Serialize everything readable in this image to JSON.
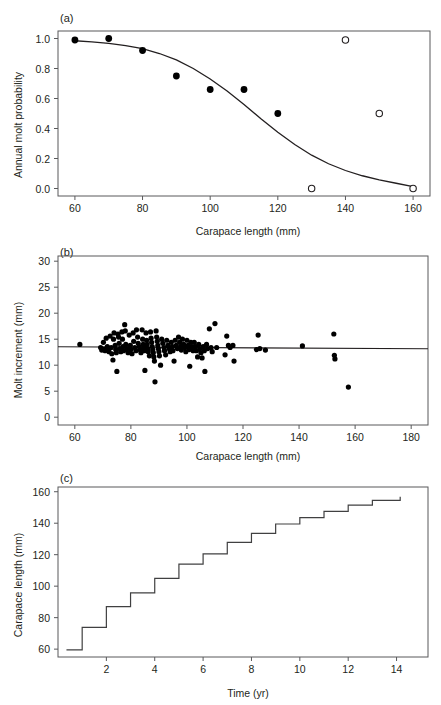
{
  "figure": {
    "width": 441,
    "height": 705,
    "background": "#ffffff",
    "ink_color": "#231f20",
    "frame_color": "#58595b"
  },
  "chart_data": [
    {
      "id": "panel-a",
      "type": "scatter",
      "panel_label": "(a)",
      "title": "",
      "xlabel": "Carapace length (mm)",
      "ylabel": "Annual molt probability",
      "xlim": [
        55,
        165
      ],
      "ylim": [
        -0.05,
        1.05
      ],
      "xticks": [
        60,
        80,
        100,
        120,
        140,
        160
      ],
      "xticklabels": [
        "60",
        "80",
        "100",
        "120",
        "140",
        "160"
      ],
      "yticks": [
        0.0,
        0.2,
        0.4,
        0.6,
        0.8,
        1.0
      ],
      "yticklabels": [
        "0.0",
        "0.2",
        "0.4",
        "0.6",
        "0.8",
        "1.0"
      ],
      "grid": false,
      "legend": "none",
      "series": [
        {
          "name": "observed (filled)",
          "marker": "filled-circle",
          "x": [
            60,
            70,
            80,
            90,
            100,
            110,
            120
          ],
          "y": [
            0.99,
            1.0,
            0.92,
            0.75,
            0.66,
            0.66,
            0.5
          ]
        },
        {
          "name": "observed (open)",
          "marker": "open-circle",
          "x": [
            130,
            140,
            150,
            160
          ],
          "y": [
            0.0,
            0.99,
            0.5,
            0.0
          ]
        },
        {
          "name": "fitted logistic curve",
          "marker": "line",
          "x": [
            60,
            65,
            70,
            75,
            80,
            85,
            90,
            95,
            100,
            105,
            110,
            115,
            120,
            125,
            130,
            135,
            140,
            145,
            150,
            155,
            160
          ],
          "y": [
            0.985,
            0.978,
            0.968,
            0.953,
            0.932,
            0.9,
            0.857,
            0.8,
            0.73,
            0.65,
            0.56,
            0.465,
            0.375,
            0.293,
            0.222,
            0.165,
            0.12,
            0.085,
            0.058,
            0.035,
            0.012
          ]
        }
      ]
    },
    {
      "id": "panel-b",
      "type": "scatter",
      "panel_label": "(b)",
      "title": "",
      "xlabel": "Carapace length (mm)",
      "ylabel": "Molt increment (mm)",
      "xlim": [
        54,
        186
      ],
      "ylim": [
        -1.5,
        31
      ],
      "xticks": [
        60,
        80,
        100,
        120,
        140,
        160,
        180
      ],
      "xticklabels": [
        "60",
        "80",
        "100",
        "120",
        "140",
        "160",
        "180"
      ],
      "yticks": [
        0,
        5,
        10,
        15,
        20,
        25,
        30
      ],
      "yticklabels": [
        "0",
        "5",
        "10",
        "15",
        "20",
        "25",
        "30"
      ],
      "grid": false,
      "legend": "none",
      "regression_line": {
        "x": [
          54,
          186
        ],
        "y": [
          13.55,
          13.15
        ]
      },
      "series": [
        {
          "name": "molt increment observations",
          "marker": "filled-circle",
          "points": [
            [
              61.8,
              14.0
            ],
            [
              69.2,
              13.4
            ],
            [
              69.6,
              12.9
            ],
            [
              70.2,
              14.4
            ],
            [
              70.4,
              13.1
            ],
            [
              70.8,
              12.8
            ],
            [
              71.2,
              15.2
            ],
            [
              71.6,
              13.6
            ],
            [
              72.0,
              13.0
            ],
            [
              72.2,
              12.6
            ],
            [
              72.6,
              15.6
            ],
            [
              73.0,
              13.4
            ],
            [
              73.2,
              12.2
            ],
            [
              73.6,
              11.0
            ],
            [
              73.8,
              15.0
            ],
            [
              74.0,
              16.2
            ],
            [
              74.4,
              13.8
            ],
            [
              74.6,
              13.0
            ],
            [
              74.8,
              12.4
            ],
            [
              75.0,
              8.8
            ],
            [
              75.4,
              16.0
            ],
            [
              75.6,
              15.4
            ],
            [
              75.8,
              14.2
            ],
            [
              76.0,
              13.2
            ],
            [
              76.4,
              12.6
            ],
            [
              76.8,
              16.4
            ],
            [
              77.0,
              15.0
            ],
            [
              77.2,
              13.6
            ],
            [
              77.4,
              12.8
            ],
            [
              77.8,
              17.8
            ],
            [
              78.0,
              16.6
            ],
            [
              78.2,
              14.0
            ],
            [
              78.6,
              13.2
            ],
            [
              79.0,
              12.4
            ],
            [
              79.4,
              15.8
            ],
            [
              79.8,
              13.8
            ],
            [
              80.0,
              13.0
            ],
            [
              80.4,
              12.2
            ],
            [
              80.8,
              16.2
            ],
            [
              81.0,
              14.6
            ],
            [
              81.4,
              13.4
            ],
            [
              81.8,
              12.8
            ],
            [
              82.0,
              16.8
            ],
            [
              82.4,
              15.4
            ],
            [
              82.6,
              14.2
            ],
            [
              83.0,
              13.6
            ],
            [
              83.2,
              13.0
            ],
            [
              83.6,
              12.4
            ],
            [
              84.0,
              16.8
            ],
            [
              84.2,
              15.0
            ],
            [
              84.4,
              14.0
            ],
            [
              84.6,
              13.4
            ],
            [
              84.8,
              12.8
            ],
            [
              85.0,
              9.0
            ],
            [
              85.4,
              16.2
            ],
            [
              85.6,
              14.8
            ],
            [
              85.8,
              14.0
            ],
            [
              86.0,
              13.2
            ],
            [
              86.2,
              12.6
            ],
            [
              86.6,
              11.8
            ],
            [
              87.0,
              16.4
            ],
            [
              87.2,
              15.2
            ],
            [
              87.4,
              14.4
            ],
            [
              87.6,
              13.6
            ],
            [
              87.8,
              13.0
            ],
            [
              88.0,
              12.4
            ],
            [
              88.2,
              11.6
            ],
            [
              88.4,
              10.8
            ],
            [
              88.6,
              6.8
            ],
            [
              89.0,
              16.6
            ],
            [
              89.2,
              15.4
            ],
            [
              89.4,
              14.6
            ],
            [
              89.6,
              13.8
            ],
            [
              89.8,
              13.2
            ],
            [
              90.0,
              12.6
            ],
            [
              90.2,
              11.8
            ],
            [
              90.6,
              10.0
            ],
            [
              91.0,
              15.0
            ],
            [
              91.4,
              14.2
            ],
            [
              91.8,
              13.4
            ],
            [
              92.0,
              12.8
            ],
            [
              92.4,
              12.0
            ],
            [
              92.8,
              14.8
            ],
            [
              93.2,
              13.8
            ],
            [
              93.6,
              13.2
            ],
            [
              94.0,
              12.6
            ],
            [
              94.4,
              14.4
            ],
            [
              94.8,
              13.6
            ],
            [
              95.0,
              12.8
            ],
            [
              95.4,
              10.8
            ],
            [
              95.8,
              14.8
            ],
            [
              96.2,
              13.8
            ],
            [
              96.6,
              13.2
            ],
            [
              97.0,
              15.4
            ],
            [
              97.4,
              14.4
            ],
            [
              97.8,
              13.6
            ],
            [
              98.0,
              12.9
            ],
            [
              98.4,
              15.0
            ],
            [
              98.8,
              14.0
            ],
            [
              99.2,
              13.4
            ],
            [
              99.6,
              12.6
            ],
            [
              100.0,
              14.8
            ],
            [
              100.4,
              13.8
            ],
            [
              100.8,
              13.0
            ],
            [
              101.0,
              9.8
            ],
            [
              101.4,
              14.4
            ],
            [
              101.8,
              13.6
            ],
            [
              102.2,
              12.8
            ],
            [
              102.6,
              14.4
            ],
            [
              103.0,
              13.6
            ],
            [
              103.4,
              12.8
            ],
            [
              103.8,
              11.6
            ],
            [
              104.2,
              14.0
            ],
            [
              104.6,
              13.2
            ],
            [
              105.0,
              12.4
            ],
            [
              105.4,
              11.4
            ],
            [
              105.8,
              13.6
            ],
            [
              106.2,
              12.8
            ],
            [
              106.4,
              8.8
            ],
            [
              107.0,
              14.0
            ],
            [
              107.4,
              13.2
            ],
            [
              108.0,
              17.0
            ],
            [
              108.6,
              13.4
            ],
            [
              109.0,
              12.6
            ],
            [
              110.0,
              18.0
            ],
            [
              110.6,
              13.4
            ],
            [
              113.6,
              12.0
            ],
            [
              114.2,
              15.6
            ],
            [
              114.8,
              13.8
            ],
            [
              115.4,
              13.4
            ],
            [
              116.4,
              13.8
            ],
            [
              116.8,
              10.8
            ],
            [
              124.8,
              13.0
            ],
            [
              125.4,
              15.8
            ],
            [
              126.0,
              13.2
            ],
            [
              128.0,
              12.9
            ],
            [
              141.2,
              13.7
            ],
            [
              152.4,
              16.0
            ],
            [
              152.6,
              11.9
            ],
            [
              152.8,
              11.2
            ],
            [
              157.6,
              5.8
            ]
          ]
        }
      ]
    },
    {
      "id": "panel-c",
      "type": "line",
      "panel_label": "(c)",
      "title": "",
      "xlabel": "Time (yr)",
      "ylabel": "Carapace length (mm)",
      "xlim": [
        0,
        15.3
      ],
      "ylim": [
        55,
        163
      ],
      "xticks": [
        2,
        4,
        6,
        8,
        10,
        12,
        14
      ],
      "xticklabels": [
        "2",
        "4",
        "6",
        "8",
        "10",
        "12",
        "14"
      ],
      "yticks": [
        60,
        80,
        100,
        120,
        140,
        160
      ],
      "yticklabels": [
        "60",
        "80",
        "100",
        "120",
        "140",
        "160"
      ],
      "grid": false,
      "legend": "none",
      "drawstyle": "steps-post",
      "series": [
        {
          "name": "growth trajectory",
          "marker": "line",
          "x": [
            0.35,
            1.0,
            2.0,
            3.0,
            4.0,
            5.0,
            6.0,
            7.0,
            8.0,
            9.0,
            10.0,
            11.0,
            12.0,
            13.0,
            14.15
          ],
          "y": [
            59.5,
            73.8,
            87.0,
            95.8,
            105.0,
            114.0,
            120.5,
            127.8,
            133.5,
            139.5,
            143.5,
            147.5,
            151.5,
            154.5,
            156.8
          ]
        }
      ]
    }
  ]
}
